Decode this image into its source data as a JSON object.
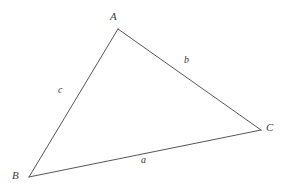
{
  "figure": {
    "type": "geometry-diagram",
    "background_color": "#ffffff",
    "stroke_color": "#55555f",
    "label_color": "#3a3a42",
    "stroke_width": 1
  },
  "vertices": [
    {
      "id": "A",
      "label": "A",
      "x": 118,
      "y": 29
    },
    {
      "id": "B",
      "label": "B",
      "x": 29,
      "y": 177
    },
    {
      "id": "C",
      "label": "C",
      "x": 261,
      "y": 130
    }
  ],
  "sides": [
    {
      "id": "a",
      "label": "a",
      "from": "B",
      "to": "C",
      "label_x": 145,
      "label_y": 162
    },
    {
      "id": "b",
      "label": "b",
      "from": "A",
      "to": "C",
      "label_x": 188,
      "label_y": 62
    },
    {
      "id": "c",
      "label": "c",
      "from": "A",
      "to": "B",
      "label_x": 62,
      "label_y": 92
    }
  ],
  "geometry": {
    "path": "M 118 29 L 261 130 L 29 177 Z",
    "edge_ab": {
      "x1": 118,
      "y1": 29,
      "x2": 29,
      "y2": 177
    },
    "edge_ac": {
      "x1": 118,
      "y1": 29,
      "x2": 261,
      "y2": 130
    },
    "edge_bc": {
      "x1": 29,
      "y1": 177,
      "x2": 261,
      "y2": 130
    }
  }
}
